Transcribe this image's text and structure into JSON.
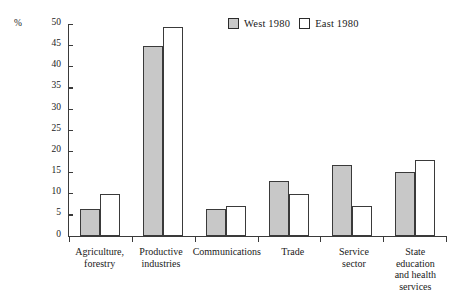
{
  "axis": {
    "unit_label": "%",
    "y_ticks": [
      0,
      5,
      10,
      15,
      20,
      25,
      30,
      35,
      40,
      45,
      50
    ]
  },
  "legend": {
    "entries": [
      {
        "label": "West 1980",
        "fill": "#c8c8c8"
      },
      {
        "label": "East 1980",
        "fill": "#ffffff"
      }
    ]
  },
  "chart_data": {
    "type": "bar",
    "title": "",
    "xlabel": "",
    "ylabel": "%",
    "ylim": [
      0,
      50
    ],
    "ytick_step": 5,
    "grid": false,
    "legend_position": "top-center",
    "categories": [
      "Agriculture, forestry",
      "Productive industries",
      "Communications",
      "Trade",
      "Service sector",
      "State education and health services"
    ],
    "category_lines": [
      [
        "Agriculture,",
        "forestry"
      ],
      [
        "Productive",
        "industries"
      ],
      [
        "Communications"
      ],
      [
        "Trade"
      ],
      [
        "Service",
        "sector"
      ],
      [
        "State education",
        "and health",
        "services"
      ]
    ],
    "series": [
      {
        "name": "West 1980",
        "color": "#c8c8c8",
        "values": [
          6.4,
          45.0,
          6.3,
          12.9,
          16.7,
          15.2
        ]
      },
      {
        "name": "East 1980",
        "color": "#ffffff",
        "values": [
          10.0,
          49.3,
          7.2,
          10.0,
          7.2,
          18.0
        ]
      }
    ]
  }
}
